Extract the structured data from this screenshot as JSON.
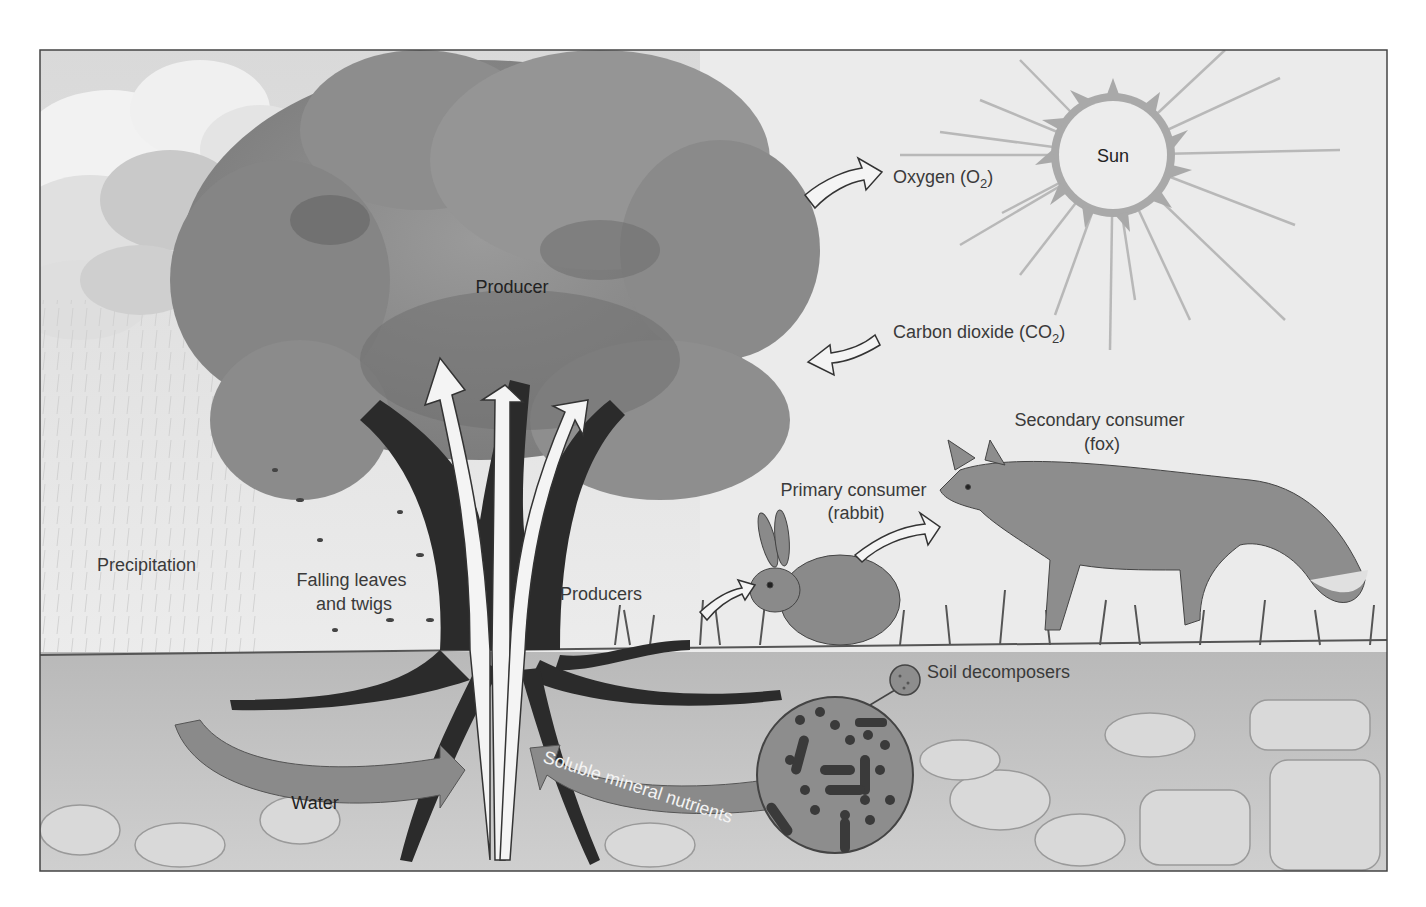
{
  "diagram": {
    "labels": {
      "sun": "Sun",
      "oxygen": "Oxygen (O",
      "oxygen_sub": "2",
      "oxygen_close": ")",
      "carbon_dioxide": "Carbon dioxide (CO",
      "carbon_dioxide_sub": "2",
      "carbon_dioxide_close": ")",
      "producer": "Producer",
      "precipitation": "Precipitation",
      "falling_leaves_line1": "Falling leaves",
      "falling_leaves_line2": "and twigs",
      "producers": "Producers",
      "primary_consumer_line1": "Primary consumer",
      "primary_consumer_line2": "(rabbit)",
      "secondary_consumer_line1": "Secondary consumer",
      "secondary_consumer_line2": "(fox)",
      "soil_decomposers": "Soil decomposers",
      "water": "Water",
      "soluble_mineral_nutrients": "Soluble mineral nutrients"
    },
    "flows": [
      {
        "from": "Producer",
        "to": "Oxygen (O2)",
        "direction": "out"
      },
      {
        "from": "Carbon dioxide (CO2)",
        "to": "Producer",
        "direction": "in"
      },
      {
        "from": "Producers",
        "to": "Primary consumer (rabbit)"
      },
      {
        "from": "Primary consumer (rabbit)",
        "to": "Secondary consumer (fox)"
      },
      {
        "from": "Water",
        "to": "Producer roots"
      },
      {
        "from": "Soil decomposers",
        "to": "Producer roots",
        "via": "Soluble mineral nutrients"
      },
      {
        "from": "Roots",
        "to": "Canopy",
        "count": 3
      }
    ],
    "colors": {
      "sky": "#e6e6e6",
      "cloud": "#cfcfcf",
      "canopy": "#8e8e8e",
      "canopy_dark": "#6a6a6a",
      "trunk": "#2b2b2b",
      "soil": "#c4c4c4",
      "soil_stone": "#d6d6d6",
      "arrow_gray": "#8a8a8a",
      "sun_ray": "#b5b5b5",
      "frame": "#444444"
    }
  }
}
